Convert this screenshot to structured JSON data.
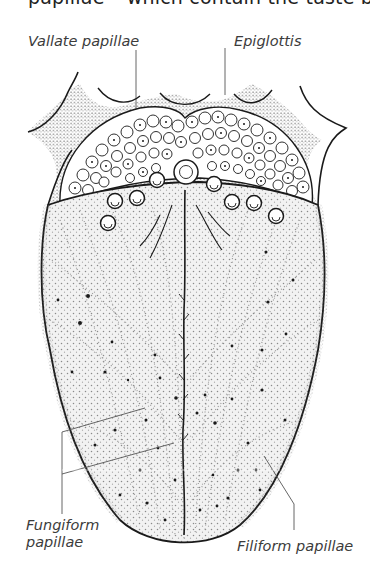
{
  "figure": {
    "top_text": "papillae – which contain the taste buds.",
    "background": "#ffffff",
    "ink_color": "#1a1a1a",
    "labels": {
      "vallate": "Vallate papillae",
      "epiglottis": "Epiglottis",
      "fungiform_line1": "Fungiform",
      "fungiform_line2": "papillae",
      "filiform": "Filiform papillae"
    }
  }
}
